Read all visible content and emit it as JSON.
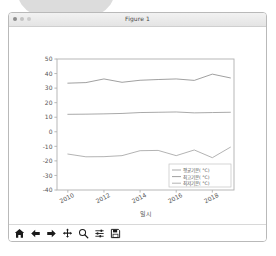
{
  "window": {
    "title": "Figure 1",
    "controls": [
      "close",
      "minimize",
      "maximize"
    ]
  },
  "toolbar": {
    "items": [
      {
        "name": "home-icon",
        "label": "Home"
      },
      {
        "name": "back-arrow-icon",
        "label": "Back"
      },
      {
        "name": "forward-arrow-icon",
        "label": "Forward"
      },
      {
        "name": "pan-move-icon",
        "label": "Pan"
      },
      {
        "name": "zoom-magnifier-icon",
        "label": "Zoom"
      },
      {
        "name": "configure-subplots-icon",
        "label": "Configure subplots"
      },
      {
        "name": "save-floppy-icon",
        "label": "Save"
      }
    ]
  },
  "chart_data": {
    "type": "line",
    "title": "",
    "xlabel": "일시",
    "ylabel": "",
    "xlim": [
      2009.4,
      2019.2
    ],
    "ylim": [
      -40,
      50
    ],
    "xticks": [
      2010,
      2012,
      2014,
      2016,
      2018
    ],
    "xticklabels": [
      "2010",
      "2012",
      "2014",
      "2016",
      "2018"
    ],
    "yticks": [
      -40,
      -30,
      -20,
      -10,
      0,
      10,
      20,
      30,
      40,
      50
    ],
    "yticklabels": [
      "-40",
      "-30",
      "-20",
      "-10",
      "0",
      "10",
      "20",
      "30",
      "40",
      "50"
    ],
    "grid": false,
    "legend_position": "lower right",
    "x": [
      2010,
      2011,
      2012,
      2013,
      2014,
      2015,
      2016,
      2017,
      2018,
      2019
    ],
    "series": [
      {
        "name": "평균기온( °C)",
        "color": "#9a9a9a",
        "values": [
          12.0,
          12.1,
          12.3,
          12.6,
          13.2,
          13.4,
          13.6,
          13.0,
          13.2,
          13.4
        ]
      },
      {
        "name": "최고기온( °C)",
        "color": "#8f8f8f",
        "values": [
          33.4,
          33.8,
          36.3,
          34.0,
          35.4,
          35.9,
          36.3,
          35.3,
          39.6,
          37.0
        ]
      },
      {
        "name": "최저기온( °C)",
        "color": "#a5a5a5",
        "values": [
          -15.3,
          -17.2,
          -17.1,
          -16.4,
          -13.0,
          -12.8,
          -16.4,
          -12.5,
          -17.8,
          -10.6
        ]
      }
    ]
  },
  "colors": {
    "axis": "#b0b0b0",
    "text": "#555555",
    "window_border": "#b9b9b9",
    "titlebar_bg": "#ebebeb"
  }
}
